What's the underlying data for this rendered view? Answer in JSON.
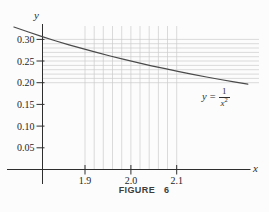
{
  "figure": {
    "caption": "FIGURE 6",
    "axis_x_label": "x",
    "axis_y_label": "y",
    "equation": {
      "lhs_var": "y",
      "equals": "=",
      "frac_numerator": "1",
      "frac_denominator_base": "x",
      "frac_denominator_exponent": "2"
    }
  },
  "colors": {
    "background": "#fcfcfc",
    "grid": "#cbcbcb",
    "axis": "#2e2e2e",
    "curve": "#4a4a4a",
    "text": "#1e1e1e",
    "caption": "#3c3c3c"
  },
  "chart_data": {
    "type": "line",
    "title": "FIGURE 6",
    "function": "y = 1/x^2",
    "xlabel": "x",
    "ylabel": "y",
    "legend": "none",
    "grid": {
      "x_values": [
        1.9,
        1.92,
        1.94,
        1.96,
        1.98,
        2.0,
        2.02,
        2.04,
        2.06,
        2.08,
        2.1
      ],
      "y_values": [
        0.2,
        0.21,
        0.22,
        0.23,
        0.24,
        0.25,
        0.26,
        0.27,
        0.28,
        0.29,
        0.3
      ]
    },
    "x_ticks": {
      "values": [
        1.9,
        2.0,
        2.1
      ],
      "labels": [
        "1.9",
        "2.0",
        "2.1"
      ]
    },
    "y_ticks": {
      "values": [
        0.05,
        0.1,
        0.15,
        0.2,
        0.25,
        0.3
      ],
      "labels": [
        "0.05",
        "0.10",
        "0.15",
        "0.20",
        "0.25",
        "0.30"
      ]
    },
    "x_range_shown": [
      1.745,
      2.255
    ],
    "ylim": [
      0,
      0.34
    ],
    "series": [
      {
        "name": "y = 1/x^2",
        "points": [
          [
            1.745,
            0.3284
          ],
          [
            1.775,
            0.3174
          ],
          [
            1.805,
            0.3069
          ],
          [
            1.835,
            0.297
          ],
          [
            1.865,
            0.2875
          ],
          [
            1.895,
            0.2785
          ],
          [
            1.925,
            0.2699
          ],
          [
            1.955,
            0.2616
          ],
          [
            1.985,
            0.2538
          ],
          [
            2.015,
            0.2463
          ],
          [
            2.045,
            0.2391
          ],
          [
            2.075,
            0.2323
          ],
          [
            2.105,
            0.2257
          ],
          [
            2.135,
            0.2194
          ],
          [
            2.165,
            0.2133
          ],
          [
            2.195,
            0.2075
          ],
          [
            2.225,
            0.202
          ],
          [
            2.255,
            0.1967
          ]
        ]
      }
    ]
  }
}
